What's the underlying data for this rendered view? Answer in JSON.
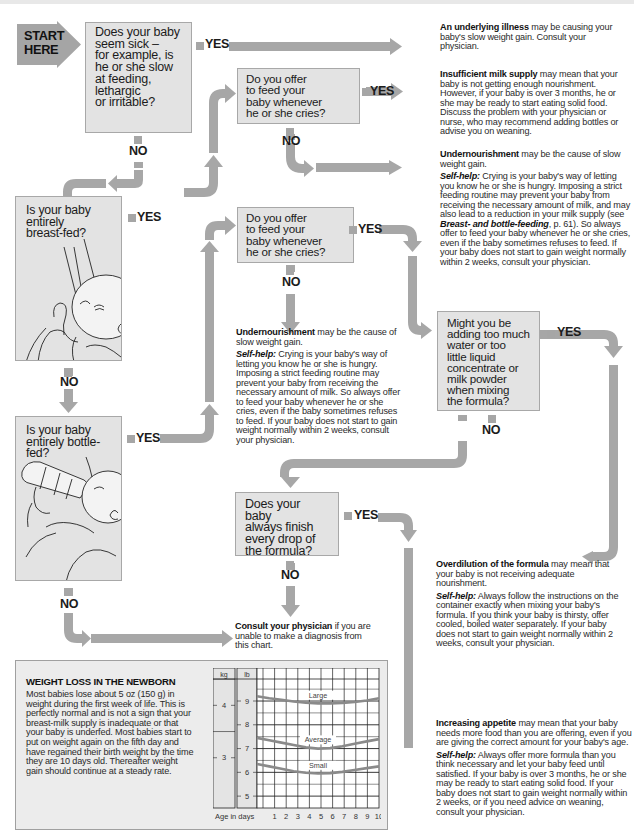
{
  "start": {
    "label": "START\nHERE"
  },
  "questions": {
    "q1": "Does your baby\nseem sick –\nfor example, is\nhe or she slow\nat feeding,\nlethargic\nor irritable?",
    "q2": "Do you offer\nto feed your\nbaby whenever\nhe or she cries?",
    "q3": "Is your baby\nentirely\nbreast-fed?",
    "q4": "Do you offer\nto feed your\nbaby whenever\nhe or she cries?",
    "q5": "Is your baby\nentirely bottle-fed?",
    "q6": "Might you be\nadding too much\nwater or too\nlittle liquid\nconcentrate or\nmilk powder\nwhen mixing\nthe formula?",
    "q7": "Does your baby\nalways finish\nevery drop of\nthe formula?"
  },
  "labels": {
    "yes": "YES",
    "no": "NO"
  },
  "answers": {
    "illness": {
      "title": "An underlying illness",
      "text": " may be causing your baby's slow weight gain. Consult your physician."
    },
    "milk_supply": {
      "title": "Insufficient milk supply",
      "text": " may mean that your baby is not getting enough nourishment. However, if your baby is over 3 months, he or she may be ready to start eating solid food. Discuss the problem with your physician or nurse, who may recommend adding bottles or advise you on weaning."
    },
    "undernourishment_breast": {
      "title": "Undernourishment",
      "text": " may be the cause of slow weight gain.",
      "selfhelp_label": "Self-help:",
      "selfhelp_a": " Crying is your baby's way of letting you know he or she is hungry. Imposing a strict feeding routine may prevent your baby from receiving the necessary amount of milk, and may also lead to a reduction in your milk supply (see ",
      "ref": "Breast- and bottle-feeding",
      "selfhelp_b": ", p. 61). So always offer to feed your baby whenever he or she cries, even if the baby sometimes refuses to feed. If your baby does not start to gain weight normally within 2 weeks, consult your physician."
    },
    "undernourishment_bottle": {
      "title": "Undernourishment",
      "text": " may be the cause of slow weight gain.",
      "selfhelp_label": "Self-help:",
      "selfhelp": " Crying is your baby's way of letting you know he or she is hungry. Imposing a strict feeding routine may prevent your baby from receiving the necessary amount of milk. So always offer to feed your baby whenever he or she cries, even if the baby sometimes refuses to feed. If your baby does not start to gain weight normally within 2 weeks, consult your physician."
    },
    "overdilution": {
      "title": "Overdilution of the formula",
      "text": " may mean that your baby is not receiving adequate nourishment.",
      "selfhelp_label": "Self-help:",
      "selfhelp": " Always follow the instructions on the container exactly when mixing your baby's formula. If you think your baby is thirsty, offer cooled, boiled water separately. If your baby does not start to gain weight normally within 2 weeks, consult your physician."
    },
    "consult": {
      "title": "Consult your physician",
      "text": " if you are unable to make a diagnosis from this chart."
    },
    "appetite": {
      "title": "Increasing appetite",
      "text": " may mean that your baby needs more food than you are offering, even if you are giving the correct amount for your baby's age.",
      "selfhelp_label": "Self-help:",
      "selfhelp": " Always offer more formula than you think necessary and let your baby feed until satisfied. If your baby is over 3 months, he or she may be ready to start eating solid food. If your baby does not start to gain weight normally within 2 weeks, or if you need advice on weaning, consult your physician."
    }
  },
  "infobox": {
    "title": "WEIGHT LOSS IN THE NEWBORN",
    "body": "Most babies lose about 5 oz (150 g) in weight during the first week of life. This is perfectly normal and is not a sign that your breast-milk supply is inadequate or that your baby is underfed. Most babies start to put on weight again on the fifth day and have regained their birth weight by the time they are 10 days old. Thereafter weight gain should continue at a steady rate."
  },
  "chart_data": {
    "type": "line",
    "title": "",
    "xlabel": "Age in days",
    "ylabel": "lb",
    "secondary_ylabel": "kg",
    "x": [
      0,
      1,
      2,
      3,
      4,
      5,
      6,
      7,
      8,
      9,
      10
    ],
    "xticks": [
      "1",
      "2",
      "3",
      "4",
      "5",
      "6",
      "7",
      "8",
      "9",
      "10"
    ],
    "yticks_lb": [
      "5",
      "6",
      "7",
      "8",
      "9"
    ],
    "yticks_kg": [
      "3",
      "4"
    ],
    "ylim": [
      4.5,
      9.8
    ],
    "grid": true,
    "series": [
      {
        "name": "Large",
        "values": [
          9.2,
          9.12,
          9.05,
          8.98,
          8.93,
          8.9,
          8.9,
          8.92,
          8.96,
          9.02,
          9.12
        ]
      },
      {
        "name": "Average",
        "values": [
          7.45,
          7.35,
          7.25,
          7.15,
          7.05,
          7.0,
          7.02,
          7.1,
          7.2,
          7.3,
          7.4
        ]
      },
      {
        "name": "Small",
        "values": [
          6.35,
          6.25,
          6.15,
          6.05,
          5.98,
          5.95,
          5.97,
          6.02,
          6.1,
          6.18,
          6.25
        ]
      }
    ]
  }
}
